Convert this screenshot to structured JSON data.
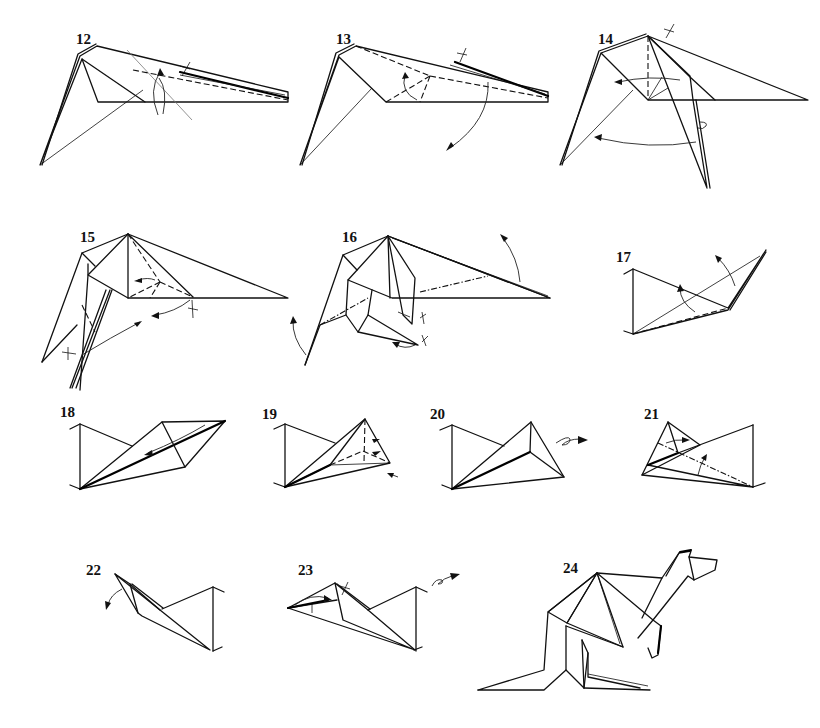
{
  "document": {
    "subject": "Origami folding sequence (kangaroo)",
    "background": "#ffffff",
    "ink_color": "#111111"
  },
  "steps": [
    {
      "number": "12",
      "symbols": [
        "valley-fold-line",
        "rotation-arrow",
        "pinch-mark"
      ]
    },
    {
      "number": "13",
      "symbols": [
        "valley-fold-lines",
        "fold-arrow-up",
        "fold-arrow-down",
        "pinch-mark"
      ]
    },
    {
      "number": "14",
      "symbols": [
        "valley-fold-line",
        "fold-arrow-left",
        "rotation-arrow",
        "turn-over-loop",
        "pinch-mark"
      ]
    },
    {
      "number": "15",
      "symbols": [
        "valley-fold-lines",
        "fold-arrows",
        "pinch-marks"
      ]
    },
    {
      "number": "16",
      "symbols": [
        "mountain-fold-lines",
        "fold-arrow-up",
        "fold-arrow-left",
        "pinch-marks"
      ]
    },
    {
      "number": "17",
      "symbols": [
        "valley-fold-line",
        "fold-arrows"
      ]
    },
    {
      "number": "18",
      "symbols": [
        "fold-arrow-left"
      ]
    },
    {
      "number": "19",
      "symbols": [
        "valley-fold-lines",
        "small-arrows"
      ]
    },
    {
      "number": "20",
      "symbols": [
        "turn-over-arrow"
      ]
    },
    {
      "number": "21",
      "symbols": [
        "mountain-fold-line",
        "fold-arrows"
      ]
    },
    {
      "number": "22",
      "symbols": [
        "fold-arrow-down"
      ]
    },
    {
      "number": "23",
      "symbols": [
        "fold-arrow",
        "pinch-mark",
        "turn-over-arrow"
      ]
    },
    {
      "number": "24",
      "symbols": [
        "finished-model"
      ]
    }
  ]
}
